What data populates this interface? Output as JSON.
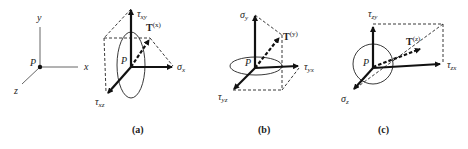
{
  "axes": {
    "origin": "P",
    "x_label": "x",
    "y_label": "y",
    "z_label": "z"
  },
  "panels": [
    {
      "caption": "(a)",
      "origin": "P",
      "traction": {
        "base": "T",
        "sup": "(x)"
      },
      "normal": {
        "base": "σ",
        "sub": "x"
      },
      "shear_1": {
        "base": "τ",
        "sub": "xy"
      },
      "shear_2": {
        "base": "τ",
        "sub": "xz"
      }
    },
    {
      "caption": "(b)",
      "origin": "P",
      "traction": {
        "base": "T",
        "sup": "(y)"
      },
      "normal": {
        "base": "σ",
        "sub": "y"
      },
      "shear_1": {
        "base": "τ",
        "sub": "yx"
      },
      "shear_2": {
        "base": "τ",
        "sub": "yz"
      }
    },
    {
      "caption": "(c)",
      "origin": "P",
      "traction": {
        "base": "T",
        "sup": "(z)"
      },
      "normal": {
        "base": "σ",
        "sub": "z"
      },
      "shear_1": {
        "base": "τ",
        "sub": "zy"
      },
      "shear_2": {
        "base": "τ",
        "sub": "zx"
      }
    }
  ]
}
